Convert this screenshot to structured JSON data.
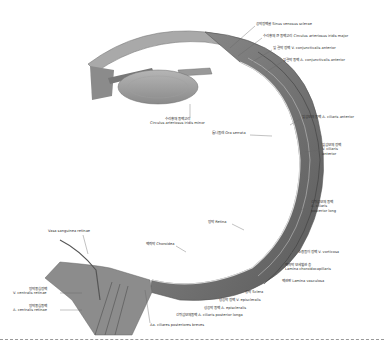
{
  "figure": {
    "labels": [
      {
        "id": "sinus-venosus-sclerae",
        "text": "공막정맥굴 Sinus venosus sclerae",
        "x": 256,
        "y": 24
      },
      {
        "id": "circulus-arteriosus-iridis-major",
        "text": "수리홍체 큰 동맥고리 Circulus arteriosus iridis major",
        "x": 263,
        "y": 36
      },
      {
        "id": "v-conjunctivalis-anterior",
        "text": "앞 결막 정맥 V. conjunctivalis anterior",
        "x": 273,
        "y": 48
      },
      {
        "id": "a-conjunctivalis-anterior",
        "text": "앞결막 동맥 A. conjunctivalis anterior",
        "x": 283,
        "y": 60
      },
      {
        "id": "a-ciliaris-anterior",
        "text": "앞섬모체 동맥 A. ciliaris anterior",
        "x": 302,
        "y": 117
      },
      {
        "id": "v-ciliaris-anterior",
        "text": "앞섬모체 정맥\nV. ciliaris\nanterior",
        "x": 322,
        "y": 147
      },
      {
        "id": "circulus-arteriosus-iridis-minor",
        "text": "수리홍채 동맥고리\nCirculus arteriosus iridis minor",
        "x": 158,
        "y": 122
      },
      {
        "id": "ora-serrata",
        "text": "톱니둘레 Ora serrata",
        "x": 210,
        "y": 133
      },
      {
        "id": "a-ciliaris-posterior-long",
        "text": "긴뒤섬모체 동맥\nA. ciliaris\nposterior long",
        "x": 311,
        "y": 205
      },
      {
        "id": "retina",
        "text": "망막 Retina",
        "x": 208,
        "y": 222
      },
      {
        "id": "v-vorticosa",
        "text": "소용돌이 정맥 V. vorticosa",
        "x": 298,
        "y": 252
      },
      {
        "id": "vasa-sanguinea-retinae",
        "text": "Vasa sanguinea retinae",
        "x": 48,
        "y": 231
      },
      {
        "id": "choroidea",
        "text": "맥락막 Choroidea",
        "x": 146,
        "y": 244
      },
      {
        "id": "lamina-choroidocapillaris",
        "text": "맥락막 모세혈관 층\nLamina choroidocapillaris",
        "x": 285,
        "y": 268
      },
      {
        "id": "lamina-vasculosa",
        "text": "맥관판 Lamina vasculosa",
        "x": 282,
        "y": 281
      },
      {
        "id": "sclera",
        "text": "공막 Sclera",
        "x": 245,
        "y": 292
      },
      {
        "id": "v-episcleralis",
        "text": "상공막 정맥 V. episcleralis",
        "x": 219,
        "y": 300
      },
      {
        "id": "a-episcleralis",
        "text": "상공막 동맥 A. episcleralis",
        "x": 204,
        "y": 308
      },
      {
        "id": "a-ciliaris-posterior-longa",
        "text": "긴뒤섬모체동맥 A. ciliaris posterior longa",
        "x": 176,
        "y": 315
      },
      {
        "id": "v-centralis-retinae",
        "text": "망막중심정맥\nV. centralis retinae",
        "x": 13,
        "y": 290
      },
      {
        "id": "a-centralis-retinae",
        "text": "망막중심동맥\nA. centralis retinae",
        "x": 13,
        "y": 307
      },
      {
        "id": "aa-ciliares-posteriores-breves",
        "text": "Aa. ciliares posteriores breves",
        "x": 150,
        "y": 325
      }
    ],
    "colors": {
      "tissue_dark": "#6e6e6e",
      "tissue_mid": "#9a9a9a",
      "tissue_light": "#cfcfcf",
      "text": "#333333",
      "background": "#ffffff",
      "divider": "#999999"
    }
  }
}
